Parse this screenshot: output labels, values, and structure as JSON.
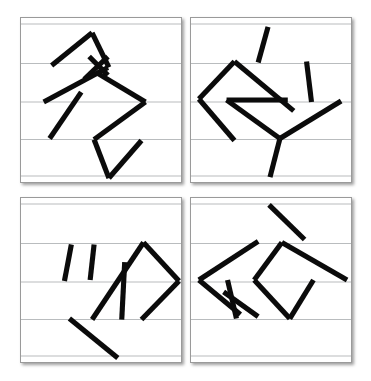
{
  "image": {
    "title": "Four-panel line-stroke pictogram grid",
    "background_color": "#ffffff",
    "width": 371,
    "height": 381
  },
  "style": {
    "panel_background": "#ffffff",
    "panel_border_color": "#9a9a9a",
    "rule_line_color": "#b9bcbe",
    "stroke_color": "#0b0b0b",
    "stroke_width": 5.2,
    "shadow_color": "rgba(0,0,0,0.38)"
  },
  "grid": {
    "rows": 2,
    "columns": 2,
    "panel_count": 4
  },
  "panels": [
    {
      "id": "panel-top-left",
      "label": "Top left panel",
      "position": {
        "left": 20,
        "top": 17,
        "width": 162,
        "height": 166
      },
      "viewbox": "0 0 162 166",
      "rule_lines_y": [
        6,
        46,
        85,
        123,
        160
      ],
      "strokes": [
        {
          "name": "stroke-1-upper-left-diagonal",
          "points": "31,48 72,15"
        },
        {
          "name": "stroke-2-apex-down-right",
          "points": "72,15 89,50"
        },
        {
          "name": "stroke-3-cross-upper",
          "points": "69,39 88,58"
        },
        {
          "name": "stroke-4-cross-lower",
          "points": "88,39 64,62"
        },
        {
          "name": "stroke-5-long-left-down",
          "points": "88,50 23,85"
        },
        {
          "name": "stroke-6-right-wedge-top",
          "points": "76,55 126,85"
        },
        {
          "name": "stroke-7-right-wedge-bottom",
          "points": "126,85 74,123"
        },
        {
          "name": "stroke-8-short-inner-diagonal",
          "points": "61,75 29,122"
        },
        {
          "name": "stroke-9-lower-v-left",
          "points": "74,123 89,162"
        },
        {
          "name": "stroke-10-lower-v-right",
          "points": "89,162 122,124"
        }
      ]
    },
    {
      "id": "panel-top-right",
      "label": "Top right panel",
      "position": {
        "left": 190,
        "top": 17,
        "width": 162,
        "height": 166
      },
      "viewbox": "0 0 162 166",
      "rule_lines_y": [
        6,
        46,
        85,
        123,
        160
      ],
      "strokes": [
        {
          "name": "stroke-1-top-short-diagonal",
          "points": "78,9 68,45"
        },
        {
          "name": "stroke-2-big-wedge-upper",
          "points": "44,44 8,82"
        },
        {
          "name": "stroke-3-big-wedge-lower",
          "points": "8,82 44,124"
        },
        {
          "name": "stroke-4-long-right-down",
          "points": "44,44 104,94"
        },
        {
          "name": "stroke-5-inner-arrow-upper",
          "points": "36,83 98,83"
        },
        {
          "name": "stroke-6-inner-arrow-lower",
          "points": "36,83 90,122"
        },
        {
          "name": "stroke-7-right-vertical",
          "points": "117,44 122,85"
        },
        {
          "name": "stroke-8-right-branch",
          "points": "152,84 90,122"
        },
        {
          "name": "stroke-9-bottom-tail",
          "points": "90,122 80,161"
        }
      ]
    },
    {
      "id": "panel-bottom-left",
      "label": "Bottom left panel",
      "position": {
        "left": 20,
        "top": 197,
        "width": 162,
        "height": 166
      },
      "viewbox": "0 0 162 166",
      "rule_lines_y": [
        6,
        46,
        85,
        123,
        160
      ],
      "strokes": [
        {
          "name": "stroke-1-left-short-vertical",
          "points": "51,47 44,84"
        },
        {
          "name": "stroke-2-second-short-vertical",
          "points": "74,47 70,83"
        },
        {
          "name": "stroke-3-diamond-upper-left",
          "points": "124,45 72,123"
        },
        {
          "name": "stroke-4-diamond-upper-right",
          "points": "124,45 160,84"
        },
        {
          "name": "stroke-5-diamond-lower-right",
          "points": "160,84 122,123"
        },
        {
          "name": "stroke-6-inner-vertical",
          "points": "105,65 102,123"
        },
        {
          "name": "stroke-7-bottom-long-diagonal",
          "points": "49,122 98,162"
        }
      ]
    },
    {
      "id": "panel-bottom-right",
      "label": "Bottom right panel",
      "position": {
        "left": 190,
        "top": 197,
        "width": 162,
        "height": 166
      },
      "viewbox": "0 0 162 166",
      "rule_lines_y": [
        6,
        46,
        85,
        123,
        160
      ],
      "strokes": [
        {
          "name": "stroke-1-top-right-diagonal",
          "points": "79,7 115,42"
        },
        {
          "name": "stroke-2-left-wedge-upper",
          "points": "68,44 8,83"
        },
        {
          "name": "stroke-3-left-wedge-lower",
          "points": "8,83 50,118"
        },
        {
          "name": "stroke-4-small-cross-vertical",
          "points": "37,83 46,122"
        },
        {
          "name": "stroke-5-small-cross-diagonal",
          "points": "33,95 68,120"
        },
        {
          "name": "stroke-6-mid-arrow-upper",
          "points": "92,45 64,83"
        },
        {
          "name": "stroke-7-mid-arrow-lower",
          "points": "64,83 100,122"
        },
        {
          "name": "stroke-8-long-right-diagonal",
          "points": "92,45 158,83"
        },
        {
          "name": "stroke-9-right-vertical",
          "points": "124,83 100,122"
        }
      ]
    }
  ]
}
